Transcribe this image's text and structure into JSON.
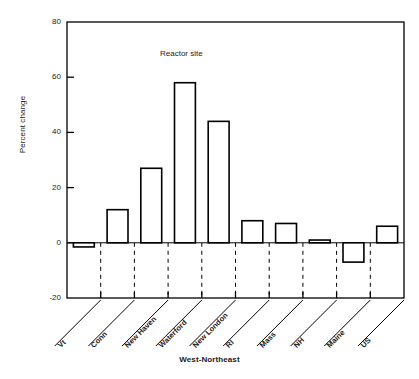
{
  "chart_data": {
    "type": "bar",
    "title": "",
    "annotation": "Reactor site",
    "xlabel": "West-Northeast",
    "ylabel": "Percent change",
    "categories": [
      "Vt",
      "Conn",
      "New Haven",
      "Waterford",
      "New London",
      "RI",
      "Mass",
      "NH",
      "Maine",
      "US"
    ],
    "values": [
      -1.5,
      12,
      27,
      58,
      44,
      8,
      7,
      1,
      -7,
      6
    ],
    "ylim": [
      -20,
      80
    ],
    "yticks": [
      -20,
      0,
      20,
      40,
      60,
      80
    ],
    "ytick_labels": [
      "-20",
      "0",
      "20",
      "40",
      "60",
      "80"
    ],
    "grid": false,
    "legend": "none",
    "bar_fill": "#ffffff",
    "bar_stroke": "#000000",
    "axis_color": "#000000",
    "background": "#ffffff"
  }
}
